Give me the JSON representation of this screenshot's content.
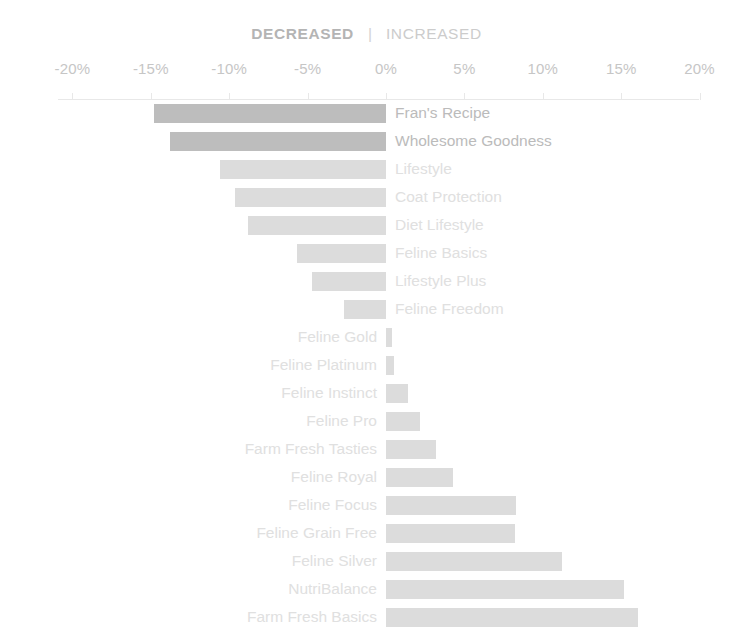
{
  "header": {
    "decreased_label": "DECREASED",
    "separator": "|",
    "increased_label": "INCREASED"
  },
  "colors": {
    "bar_dark": "#bdbdbd",
    "bar_light": "#dcdcdc",
    "bar_lightest": "#e2e2e2",
    "label_dark": "#bbbbbb",
    "label_light": "#e0e0e0",
    "axis": "#e8e8e8",
    "tick_text": "#c6c6c6",
    "background": "#ffffff"
  },
  "chart_data": {
    "type": "bar",
    "orientation": "horizontal",
    "title": "",
    "subtitle": "",
    "xlabel": "",
    "ylabel": "",
    "xlim": [
      -20,
      20
    ],
    "xticks": [
      -20,
      -15,
      -10,
      -5,
      0,
      5,
      10,
      15,
      20
    ],
    "xtick_labels": [
      "-20%",
      "-15%",
      "-10%",
      "-5%",
      "0%",
      "5%",
      "10%",
      "15%",
      "20%"
    ],
    "grid": false,
    "legend": "none",
    "zero_baseline": 0,
    "categories": [
      "Fran's Recipe",
      "Wholesome Goodness",
      "Lifestyle",
      "Coat Protection",
      "Diet Lifestyle",
      "Feline Basics",
      "Lifestyle Plus",
      "Feline Freedom",
      "Feline Gold",
      "Feline Platinum",
      "Feline Instinct",
      "Feline Pro",
      "Farm Fresh Tasties",
      "Feline Royal",
      "Feline Focus",
      "Feline Grain Free",
      "Feline Silver",
      "NutriBalance",
      "Farm Fresh Basics"
    ],
    "values": [
      -14.8,
      -13.8,
      -10.6,
      -9.6,
      -8.8,
      -5.7,
      -4.7,
      -2.7,
      0.4,
      0.5,
      1.4,
      2.2,
      3.2,
      4.3,
      8.3,
      8.2,
      11.2,
      15.2,
      16.1
    ]
  },
  "bars": [
    {
      "label": "Fran's Recipe",
      "value": -14.8,
      "emphasis": "dark",
      "label_side": "right"
    },
    {
      "label": "Wholesome Goodness",
      "value": -13.8,
      "emphasis": "dark",
      "label_side": "right"
    },
    {
      "label": "Lifestyle",
      "value": -10.6,
      "emphasis": "light",
      "label_side": "right"
    },
    {
      "label": "Coat Protection",
      "value": -9.6,
      "emphasis": "light",
      "label_side": "right"
    },
    {
      "label": "Diet Lifestyle",
      "value": -8.8,
      "emphasis": "light",
      "label_side": "right"
    },
    {
      "label": "Feline Basics",
      "value": -5.7,
      "emphasis": "light",
      "label_side": "right"
    },
    {
      "label": "Lifestyle Plus",
      "value": -4.7,
      "emphasis": "light",
      "label_side": "right"
    },
    {
      "label": "Feline Freedom",
      "value": -2.7,
      "emphasis": "light",
      "label_side": "right"
    },
    {
      "label": "Feline Gold",
      "value": 0.4,
      "emphasis": "light",
      "label_side": "left"
    },
    {
      "label": "Feline Platinum",
      "value": 0.5,
      "emphasis": "light",
      "label_side": "left"
    },
    {
      "label": "Feline Instinct",
      "value": 1.4,
      "emphasis": "light",
      "label_side": "left"
    },
    {
      "label": "Feline Pro",
      "value": 2.2,
      "emphasis": "light",
      "label_side": "left"
    },
    {
      "label": "Farm Fresh Tasties",
      "value": 3.2,
      "emphasis": "light",
      "label_side": "left"
    },
    {
      "label": "Feline Royal",
      "value": 4.3,
      "emphasis": "light",
      "label_side": "left"
    },
    {
      "label": "Feline Focus",
      "value": 8.3,
      "emphasis": "light",
      "label_side": "left"
    },
    {
      "label": "Feline Grain Free",
      "value": 8.2,
      "emphasis": "light",
      "label_side": "left"
    },
    {
      "label": "Feline Silver",
      "value": 11.2,
      "emphasis": "light",
      "label_side": "left"
    },
    {
      "label": "NutriBalance",
      "value": 15.2,
      "emphasis": "light",
      "label_side": "left"
    },
    {
      "label": "Farm Fresh Basics",
      "value": 16.1,
      "emphasis": "light",
      "label_side": "left"
    }
  ],
  "geometry": {
    "zero_x": 386,
    "px_per_percent": 15.68,
    "row_pitch": 28,
    "bar_height": 19,
    "plot_top": 100,
    "label_gap": 9
  }
}
